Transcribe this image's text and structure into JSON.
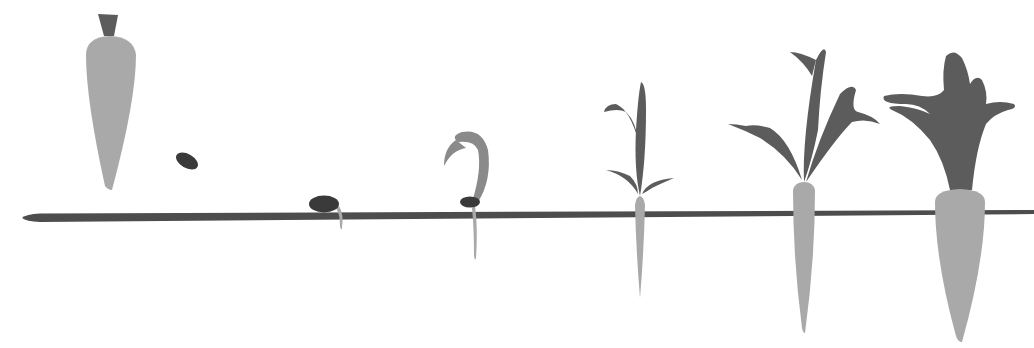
{
  "title": "Carrot growth stages",
  "colors": {
    "background": "#ffffff",
    "ground": "#4d4d4d",
    "root": "#a9a9a9",
    "foliage": "#5c5c5c",
    "seed": "#3a3a3a",
    "sprout": "#8a8a8a"
  },
  "stages": [
    {
      "id": "mature-carrot-reference",
      "label": "Carrot"
    },
    {
      "id": "seed",
      "label": "Seed"
    },
    {
      "id": "planted-seed",
      "label": "Planted seed"
    },
    {
      "id": "germination",
      "label": "Germinating seedling"
    },
    {
      "id": "seedling",
      "label": "Seedling with true leaves"
    },
    {
      "id": "young-carrot",
      "label": "Young carrot"
    },
    {
      "id": "mature-carrot",
      "label": "Mature carrot"
    }
  ]
}
